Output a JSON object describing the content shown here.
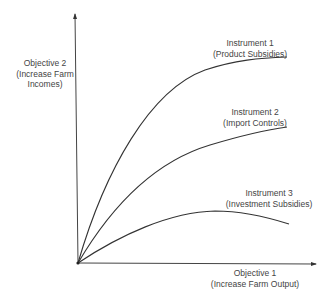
{
  "diagram": {
    "y_axis": {
      "line1": "Objective 2",
      "line2": "(Increase Farm",
      "line3": "Incomes)"
    },
    "x_axis": {
      "line1": "Objective 1",
      "line2": "(Increase Farm Output)"
    },
    "curves": [
      {
        "line1": "Instrument 1",
        "line2": "(Product Subsidies)"
      },
      {
        "line1": "Instrument 2",
        "line2": "(Import Controls)"
      },
      {
        "line1": "Instrument 3",
        "line2": "(Investment Subsidies)"
      }
    ],
    "colors": {
      "line": "#333333",
      "text": "#444444"
    }
  }
}
